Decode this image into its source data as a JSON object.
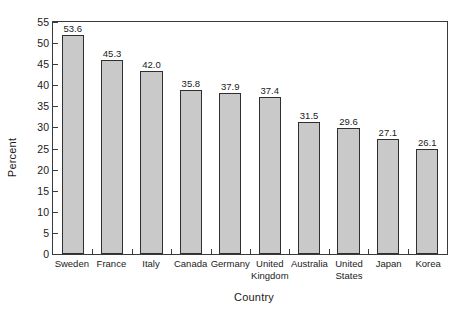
{
  "chart_data": {
    "type": "bar",
    "title": "",
    "subtitle": "",
    "xlabel": "Country",
    "ylabel": "Percent",
    "categories": [
      "Sweden",
      "France",
      "Italy",
      "Canada",
      "Germany",
      "United Kingdom",
      "Australia",
      "United States",
      "Japan",
      "Korea"
    ],
    "values": [
      53.6,
      45.3,
      42.0,
      35.8,
      37.9,
      37.4,
      31.5,
      29.6,
      27.1,
      26.1
    ],
    "data_labels": [
      "53.6",
      "45.3",
      "42.0",
      "35.8",
      "37.9",
      "37.4",
      "31.5",
      "29.6",
      "27.1",
      "26.1"
    ],
    "drawn_bar_heights": [
      52.0,
      46.0,
      43.5,
      39.0,
      38.2,
      37.3,
      31.3,
      29.8,
      27.2,
      24.8
    ],
    "ylim": [
      0,
      55
    ],
    "ytick_values": [
      0,
      5,
      10,
      15,
      20,
      25,
      30,
      35,
      40,
      45,
      50,
      55
    ],
    "ytick_labels": [
      "0",
      "5",
      "10",
      "15",
      "20",
      "25",
      "30",
      "35",
      "40",
      "45",
      "50",
      "55"
    ],
    "grid": false,
    "legend": null,
    "legend_position": "none",
    "bar_fill_color": "#c9c9c9",
    "bar_edge_color": "#2f2f2f",
    "axis_color": "#3a3a3a",
    "background_color": "#ffffff",
    "category_label_lines": [
      [
        "Sweden"
      ],
      [
        "France"
      ],
      [
        "Italy"
      ],
      [
        "Canada"
      ],
      [
        "Germany"
      ],
      [
        "United",
        "Kingdom"
      ],
      [
        "Australia"
      ],
      [
        "United",
        "States"
      ],
      [
        "Japan"
      ],
      [
        "Korea"
      ]
    ]
  }
}
